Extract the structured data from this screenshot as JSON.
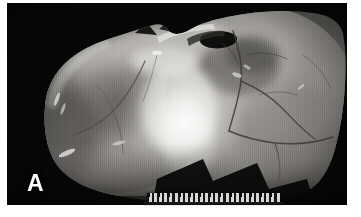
{
  "figure": {
    "panel_label": "A",
    "caption_visible": false,
    "background_color": "#ffffff",
    "plate_background_color": "#050505",
    "label_color": "#ffffff"
  },
  "photo": {
    "subject": "skeletal-specimen-macro-photograph",
    "color_mode": "grayscale",
    "description": "Grayscale macro photograph of a bone specimen viewed against a black background, showing smooth cortical bone surfaces, branching suture lines across the right side, a dark fissure near the superior margin, and a bright highlighted central region.",
    "tone_range": {
      "darkest": "#050505",
      "midtone": "#8e8e8e",
      "brightest": "#f6f6f4"
    }
  },
  "scale_bar": {
    "present": true,
    "type": "ruler",
    "orientation": "horizontal",
    "tick_count": 26,
    "major_tick_count": 13,
    "body_color": "#d8d6d2",
    "tick_color": "#151515"
  }
}
